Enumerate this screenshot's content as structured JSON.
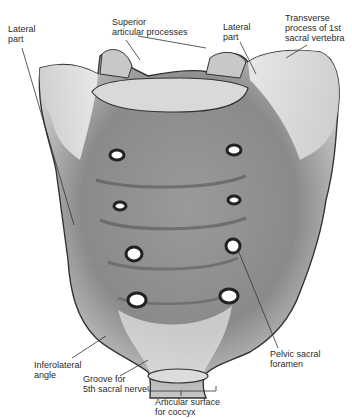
{
  "figure": {
    "labels": [
      {
        "id": "lateral-part-left",
        "text": "Lateral\npart",
        "x": 8,
        "y": 24
      },
      {
        "id": "superior-articular-processes",
        "text": "Superior\narticular processes",
        "x": 112,
        "y": 19
      },
      {
        "id": "lateral-part-right",
        "text": "Lateral\npart",
        "x": 223,
        "y": 22
      },
      {
        "id": "transverse-process",
        "text": "Transverse\nprocess of 1st\nsacral vertebra",
        "x": 285,
        "y": 13
      },
      {
        "id": "inferolateral-angle",
        "text": "Inferolateral\nangle",
        "x": 34,
        "y": 361
      },
      {
        "id": "groove-5th-sacral-nerve",
        "text": "Groove for\n5th sacral nerve",
        "x": 83,
        "y": 375
      },
      {
        "id": "pelvic-sacral-foramen",
        "text": "Pelvic sacral\nforamen",
        "x": 270,
        "y": 350
      },
      {
        "id": "articular-surface-coccyx",
        "text": "Articular surface\nfor coccyx",
        "x": 155,
        "y": 397
      }
    ]
  }
}
